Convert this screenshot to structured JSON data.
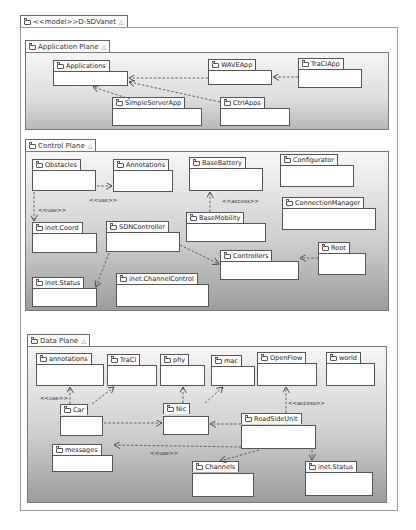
{
  "model": {
    "title": "<<model>>D-SDVanet",
    "collapse_icon": "△"
  },
  "planes": {
    "application": {
      "title": "Application Plane",
      "packages": {
        "applications": "Applications",
        "wave_app": "WAVEApp",
        "traci_app": "TraCIApp",
        "simple_server_app": "SimpleServerApp",
        "ctrl_apps": "CtrlApps"
      }
    },
    "control": {
      "title": "Control Plane",
      "packages": {
        "obstacles": "Obstacles",
        "annotations": "Annotations",
        "base_battery": "BaseBattery",
        "configurator": "Configurator",
        "connection_manager": "ConnectionManager",
        "inet_coord": "inet.Coord",
        "sdn_controller": "SDNController",
        "base_mobility": "BaseMobility",
        "controllers": "Controllers",
        "root": "Root",
        "inet_status": "inet.Status",
        "inet_channel_control": "inet.ChannelControl"
      },
      "labels": {
        "use_1": "<<use>>",
        "use_2": "<<use>>",
        "access": "<<access>>"
      }
    },
    "data": {
      "title": "Data Plane",
      "packages": {
        "annotations": "annotations",
        "traci": "TraCI",
        "phy": "phy",
        "mac": "mac",
        "openflow": "OpenFlow",
        "world": "world",
        "car": "Car",
        "nic": "Nic",
        "road_side_unit": "RoadSideUnit",
        "messages": "messages",
        "channels": "Channels",
        "inet_status": "inet.Status"
      },
      "labels": {
        "use_1": "<<use>>",
        "use_2": "<<use>>",
        "access": "<<access>>"
      }
    }
  },
  "icons": {
    "package": "folder-icon",
    "collapse": "collapse-triangle-icon"
  }
}
